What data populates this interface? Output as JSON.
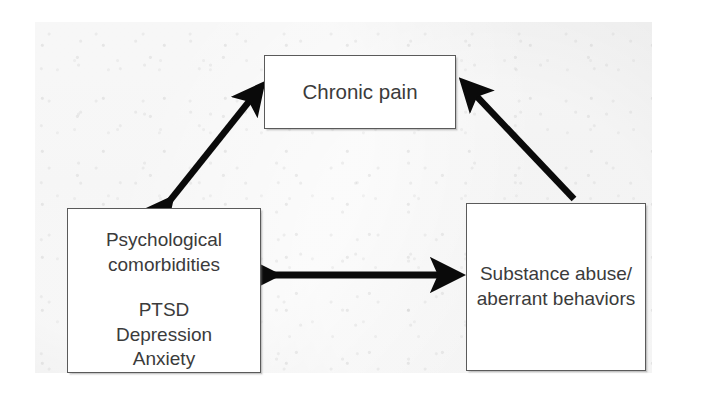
{
  "figure": {
    "title": "Chronic pain, psychological comorbidities and substance abuse triad",
    "background_color": "#e8e8e8",
    "page_color": "#ffffff",
    "box_fill": "#ffffff",
    "box_border_color": "#5a5a5a",
    "text_color": "#3b3b3b",
    "arrow_color": "#000000"
  },
  "nodes": {
    "chronic_pain": {
      "label": "Chronic pain",
      "lines": [
        "Chronic pain"
      ]
    },
    "psychological": {
      "label": "Psychological comorbidities",
      "lines": [
        "Psychological",
        "comorbidities"
      ],
      "items": [
        "PTSD",
        "Depression",
        "Anxiety"
      ]
    },
    "substance": {
      "label": "Substance abuse/aberrant behaviors",
      "lines": [
        "Substance abuse/",
        "aberrant behaviors"
      ]
    }
  },
  "edges": [
    {
      "id": "psychological-chronic-pain",
      "from": "psychological",
      "to": "chronic_pain",
      "direction": "bidirectional",
      "heads": 2,
      "orientation": "diagonal-up-right"
    },
    {
      "id": "substance-chronic-pain",
      "from": "substance",
      "to": "chronic_pain",
      "direction": "unidirectional",
      "heads": 1,
      "orientation": "diagonal-up-left"
    },
    {
      "id": "psychological-substance",
      "from": "psychological",
      "to": "substance",
      "direction": "bidirectional",
      "heads": 2,
      "orientation": "horizontal"
    }
  ]
}
